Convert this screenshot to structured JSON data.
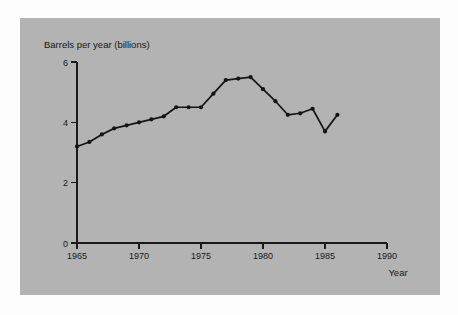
{
  "figure": {
    "panel_background": "#b3b3b3",
    "page_background": "#fdfdfd",
    "ink_color": "#141414"
  },
  "chart_data": {
    "type": "line",
    "title": "",
    "ylabel": "Barrels per year (billions)",
    "xlabel": "Year",
    "xlim": [
      1965,
      1990
    ],
    "ylim": [
      0,
      6
    ],
    "grid": false,
    "legend": "none",
    "x_ticks": [
      "1965",
      "1970",
      "1975",
      "1980",
      "1985",
      "1990"
    ],
    "x_tick_values": [
      1965,
      1970,
      1975,
      1980,
      1985,
      1990
    ],
    "y_ticks": [
      "0",
      "2",
      "4",
      "6"
    ],
    "y_tick_values": [
      0,
      2,
      4,
      6
    ],
    "marker": "filled-circle",
    "x": [
      1965,
      1966,
      1967,
      1968,
      1969,
      1970,
      1971,
      1972,
      1973,
      1974,
      1975,
      1976,
      1977,
      1978,
      1979,
      1980,
      1981,
      1982,
      1983,
      1984,
      1985,
      1986
    ],
    "values": [
      3.2,
      3.35,
      3.6,
      3.8,
      3.9,
      4.0,
      4.1,
      4.2,
      4.5,
      4.5,
      4.5,
      4.95,
      5.4,
      5.45,
      5.5,
      5.1,
      4.7,
      4.25,
      4.3,
      4.45,
      3.7,
      4.25
    ],
    "series": [
      {
        "name": "World oil production",
        "values": [
          3.2,
          3.35,
          3.6,
          3.8,
          3.9,
          4.0,
          4.1,
          4.2,
          4.5,
          4.5,
          4.5,
          4.95,
          5.4,
          5.45,
          5.5,
          5.1,
          4.7,
          4.25,
          4.3,
          4.45,
          3.7,
          4.25
        ]
      }
    ]
  }
}
